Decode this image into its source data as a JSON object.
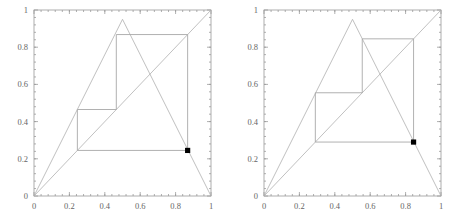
{
  "figure": {
    "kind": "two-panel-cobweb-plot",
    "background": "#ffffff",
    "line_color": "#b0b0b0",
    "frame_color": "#9a9a9a",
    "point_color": "#000000"
  },
  "chart_data": [
    {
      "type": "line",
      "name": "left-panel",
      "title": "",
      "xlabel": "",
      "ylabel": "",
      "xlim": [
        0,
        1
      ],
      "ylim": [
        0,
        1
      ],
      "grid": false,
      "legend": "none",
      "xticks": [
        0,
        0.2,
        0.4,
        0.6,
        0.8,
        1
      ],
      "xticklabels": [
        "0",
        "0.2",
        "0.4",
        "0.6",
        "0.8",
        "1"
      ],
      "yticks": [
        0,
        0.2,
        0.4,
        0.6,
        0.8,
        1
      ],
      "yticklabels": [
        "0",
        "0.2",
        "0.4",
        "0.6",
        "0.8",
        "1"
      ],
      "series": [
        {
          "name": "tent-map",
          "peak_x": 0.5,
          "peak_y": 0.95,
          "x": [
            0,
            0.5,
            1
          ],
          "values": [
            0,
            0.95,
            0
          ]
        },
        {
          "name": "identity-line",
          "x": [
            0,
            1
          ],
          "values": [
            0,
            1
          ]
        },
        {
          "name": "cobweb-orbit",
          "path_x": [
            0.245,
            0.245,
            0.465,
            0.465,
            0.868,
            0.868,
            0.245
          ],
          "path_y": [
            0.245,
            0.465,
            0.465,
            0.868,
            0.868,
            0.245,
            0.245
          ]
        }
      ],
      "annotations": [
        {
          "name": "orbit-point",
          "x": 0.868,
          "y": 0.245,
          "marker": "filled-square"
        }
      ]
    },
    {
      "type": "line",
      "name": "right-panel",
      "title": "",
      "xlabel": "",
      "ylabel": "",
      "xlim": [
        0,
        1
      ],
      "ylim": [
        0,
        1
      ],
      "grid": false,
      "legend": "none",
      "xticks": [
        0,
        0.2,
        0.4,
        0.6,
        0.8,
        1
      ],
      "xticklabels": [
        "0",
        "0.2",
        "0.4",
        "0.6",
        "0.8",
        "1"
      ],
      "yticks": [
        0,
        0.2,
        0.4,
        0.6,
        0.8,
        1
      ],
      "yticklabels": [
        "0",
        "0.2",
        "0.4",
        "0.6",
        "0.8",
        "1"
      ],
      "series": [
        {
          "name": "tent-map",
          "peak_x": 0.5,
          "peak_y": 0.95,
          "x": [
            0,
            0.5,
            1
          ],
          "values": [
            0,
            0.95,
            0
          ]
        },
        {
          "name": "identity-line",
          "x": [
            0,
            1
          ],
          "values": [
            0,
            1
          ]
        },
        {
          "name": "cobweb-orbit",
          "path_x": [
            0.29,
            0.29,
            0.555,
            0.555,
            0.845,
            0.845,
            0.29
          ],
          "path_y": [
            0.29,
            0.555,
            0.555,
            0.845,
            0.845,
            0.29,
            0.29
          ]
        }
      ],
      "annotations": [
        {
          "name": "orbit-point",
          "x": 0.845,
          "y": 0.29,
          "marker": "filled-square"
        }
      ]
    }
  ]
}
